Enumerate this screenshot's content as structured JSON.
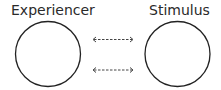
{
  "diagram": {
    "nodes": [
      {
        "id": "experiencer",
        "label": "Experiencer"
      },
      {
        "id": "stimulus",
        "label": "Stimulus"
      }
    ],
    "edges": [
      {
        "from": "experiencer",
        "to": "stimulus",
        "style": "dashed",
        "direction": "bidirectional"
      },
      {
        "from": "experiencer",
        "to": "stimulus",
        "style": "dashed",
        "direction": "bidirectional"
      }
    ],
    "colors": {
      "stroke": "#222222",
      "arrow": "#444444"
    }
  }
}
